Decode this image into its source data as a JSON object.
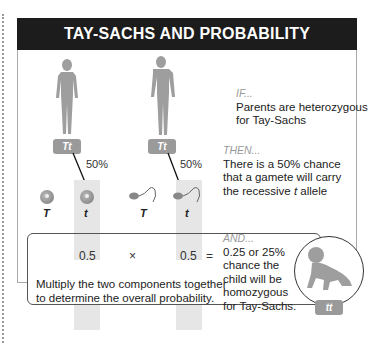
{
  "title": "TAY-SACHS AND PROBABILITY",
  "parents": [
    {
      "figure": "female",
      "genotype": "Tt",
      "percent": "50%"
    },
    {
      "figure": "male",
      "genotype": "Tt",
      "percent": "50%"
    }
  ],
  "gametes": {
    "female": [
      {
        "type": "egg",
        "allele": "T"
      },
      {
        "type": "egg",
        "allele": "t"
      }
    ],
    "male": [
      {
        "type": "sperm",
        "allele": "T"
      },
      {
        "type": "sperm",
        "allele": "t"
      }
    ]
  },
  "if": {
    "head": "IF...",
    "line1": "Parents are heterozygous",
    "line2": "for Tay-Sachs"
  },
  "then": {
    "head": "THEN...",
    "line1": "There is a 50% chance",
    "line2": "that a gamete will carry",
    "line3_pre": "the recessive ",
    "line3_allele": "t",
    "line3_post": " allele"
  },
  "calc": {
    "value1": "0.5",
    "times": "×",
    "value2": "0.5",
    "equals": "=",
    "instruction_line1": "Multiply the two components together",
    "instruction_line2": "to determine the overall probability."
  },
  "and": {
    "head": "AND...",
    "lines": [
      "0.25 or 25%",
      "chance the",
      "child will be",
      "homozygous",
      "for Tay-Sachs."
    ]
  },
  "child": {
    "genotype": "tt"
  }
}
